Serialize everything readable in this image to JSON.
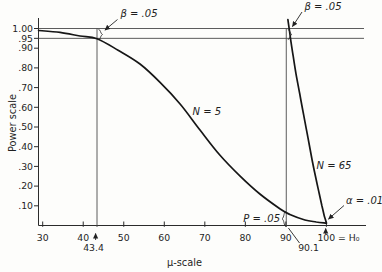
{
  "chart_data": {
    "type": "line",
    "title": "",
    "xlabel": "μ-scale",
    "ylabel": "Power scale",
    "xlim": [
      30,
      100
    ],
    "ylim": [
      0,
      1.0
    ],
    "grid": false,
    "legend": "none (curves labeled inline)",
    "x_ticks": [
      30,
      40,
      50,
      60,
      70,
      80,
      90,
      100
    ],
    "x_tick_labels": [
      "30",
      "40",
      "50",
      "60",
      "70",
      "80",
      "90",
      "100 = H₀"
    ],
    "y_ticks": [
      1.0,
      0.95,
      0.9,
      0.8,
      0.7,
      0.6,
      0.5,
      0.4,
      0.3,
      0.2,
      0.1
    ],
    "y_tick_labels": [
      "1.00",
      ".95",
      ".90",
      ".80",
      ".70",
      ".60",
      ".50",
      ".40",
      ".30",
      ".20",
      ".10"
    ],
    "reference_lines": {
      "horizontal_at_power": [
        1.0,
        0.95
      ],
      "vertical_at_mu": [
        43.4,
        90.1
      ]
    },
    "series": [
      {
        "name": "N = 5",
        "points": [
          [
            29.0,
            0.99
          ],
          [
            34.3,
            0.98
          ],
          [
            39.2,
            0.962
          ],
          [
            43.4,
            0.948
          ],
          [
            48.6,
            0.89
          ],
          [
            54.0,
            0.82
          ],
          [
            58.9,
            0.728
          ],
          [
            63.9,
            0.617
          ],
          [
            68.8,
            0.485
          ],
          [
            73.7,
            0.358
          ],
          [
            78.7,
            0.251
          ],
          [
            83.6,
            0.16
          ],
          [
            88.6,
            0.084
          ],
          [
            91.0,
            0.056
          ],
          [
            94.7,
            0.028
          ],
          [
            97.5,
            0.018
          ],
          [
            100,
            0.012
          ]
        ]
      },
      {
        "name": "N = 65",
        "points": [
          [
            90.5,
            1.045
          ],
          [
            90.85,
            0.995
          ],
          [
            91.25,
            0.935
          ],
          [
            91.8,
            0.86
          ],
          [
            92.5,
            0.77
          ],
          [
            93.4,
            0.67
          ],
          [
            94.4,
            0.56
          ],
          [
            95.45,
            0.445
          ],
          [
            96.5,
            0.33
          ],
          [
            97.4,
            0.24
          ],
          [
            98.2,
            0.165
          ],
          [
            98.9,
            0.1
          ],
          [
            99.4,
            0.055
          ],
          [
            99.75,
            0.03
          ],
          [
            100,
            0.012
          ]
        ]
      }
    ],
    "annotations": {
      "beta_left": "β = .05",
      "beta_right": "β = .05",
      "alpha": "α = .01",
      "p": "P = .05",
      "n5": "N = 5",
      "n65": "N = 65",
      "mu_434": "43.4",
      "mu_901": "90.1"
    }
  }
}
